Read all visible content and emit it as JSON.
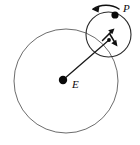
{
  "figure": {
    "background_color": "#ffffff",
    "width": 140,
    "height": 145
  },
  "labels": {
    "earth": "E",
    "planet": "P"
  },
  "bodies": [
    {
      "name": "earth-body",
      "label": "E",
      "cx": 63,
      "cy": 80,
      "r": 4.2,
      "color": "#0a0a0a",
      "label_x": 72,
      "label_y": 88
    },
    {
      "name": "planet-body",
      "label": "P",
      "cx": 115,
      "cy": 15,
      "r": 3.6,
      "color": "#0a0a0a",
      "label_x": 123,
      "label_y": 12
    },
    {
      "name": "epicycle-center-body",
      "label": "",
      "cx": 109,
      "cy": 40,
      "r": 1.9,
      "color": "#0a0a0a",
      "label_x": 0,
      "label_y": 0
    }
  ],
  "circles": [
    {
      "name": "deferent-circle",
      "cx": 66,
      "cy": 81,
      "r": 52,
      "stroke": "#5b5b5b",
      "stroke_width": 0.9
    },
    {
      "name": "epicycle-circle",
      "cx": 108.5,
      "cy": 34.5,
      "r": 22.5,
      "stroke": "#2b2b2b",
      "stroke_width": 1.1
    }
  ],
  "radius_line": {
    "name": "deferent-radius-line",
    "x1": 64,
    "y1": 79,
    "x2": 109,
    "y2": 40,
    "stroke": "#1a1a1a"
  },
  "motion_arrows": [
    {
      "name": "epicycle-rotation-arrow",
      "description": "curved arrow above planet P indicating epicycle rotation, pointing left",
      "path": "M 119 9 C 112 4, 100 4, 93 9",
      "head_points": "93,9 99,6.5 98,12"
    },
    {
      "name": "deferent-motion-arrow-up",
      "description": "short arrow at epicycle center pointing up-right",
      "path": "M 103 40 L 113 30",
      "head_points": "114.5,28.5 108.5,30.5 112.5,34.5"
    },
    {
      "name": "deferent-motion-arrow-down",
      "description": "short arrow at epicycle center pointing down-right",
      "path": "M 109 33 L 116 44",
      "head_points": "117.5,46.5 111,43 116,39.5"
    }
  ]
}
